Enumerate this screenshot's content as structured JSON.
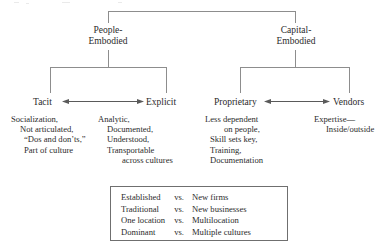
{
  "tree": {
    "branches": [
      {
        "id": "people",
        "label_line1": "People-",
        "label_line2": "Embodied",
        "leaves": [
          {
            "id": "tacit",
            "label": "Tacit",
            "details": [
              "Socialization,",
              "Not articulated,",
              "“Dos and don’ts,”",
              "Part of culture"
            ]
          },
          {
            "id": "explicit",
            "label": "Explicit",
            "details": [
              "Analytic,",
              "Documented,",
              "Understood,",
              "Transportable",
              "across cultures"
            ]
          }
        ]
      },
      {
        "id": "capital",
        "label_line1": "Capital-",
        "label_line2": "Embodied",
        "leaves": [
          {
            "id": "proprietary",
            "label": "Proprietary",
            "details": [
              "Less dependent",
              "on people,",
              "Skill sets key,",
              "Training,",
              "Documentation"
            ]
          },
          {
            "id": "vendors",
            "label": "Vendors",
            "details": [
              "Expertise—",
              "Inside/outside"
            ]
          }
        ]
      }
    ]
  },
  "comparison": {
    "separator": "vs.",
    "rows": [
      {
        "left": "Established",
        "vs": "vs.",
        "right": "New firms"
      },
      {
        "left": "Traditional",
        "vs": "vs.",
        "right": "New businesses"
      },
      {
        "left": "One location",
        "vs": "vs.",
        "right": "Multilocation"
      },
      {
        "left": "Dominant",
        "vs": "vs.",
        "right": "Multiple cultures"
      }
    ]
  },
  "style": {
    "line_color": "#8d8d8d",
    "box_border_color": "#6f6f6f",
    "text_color": "#2b2b2b",
    "background": "#ffffff"
  }
}
